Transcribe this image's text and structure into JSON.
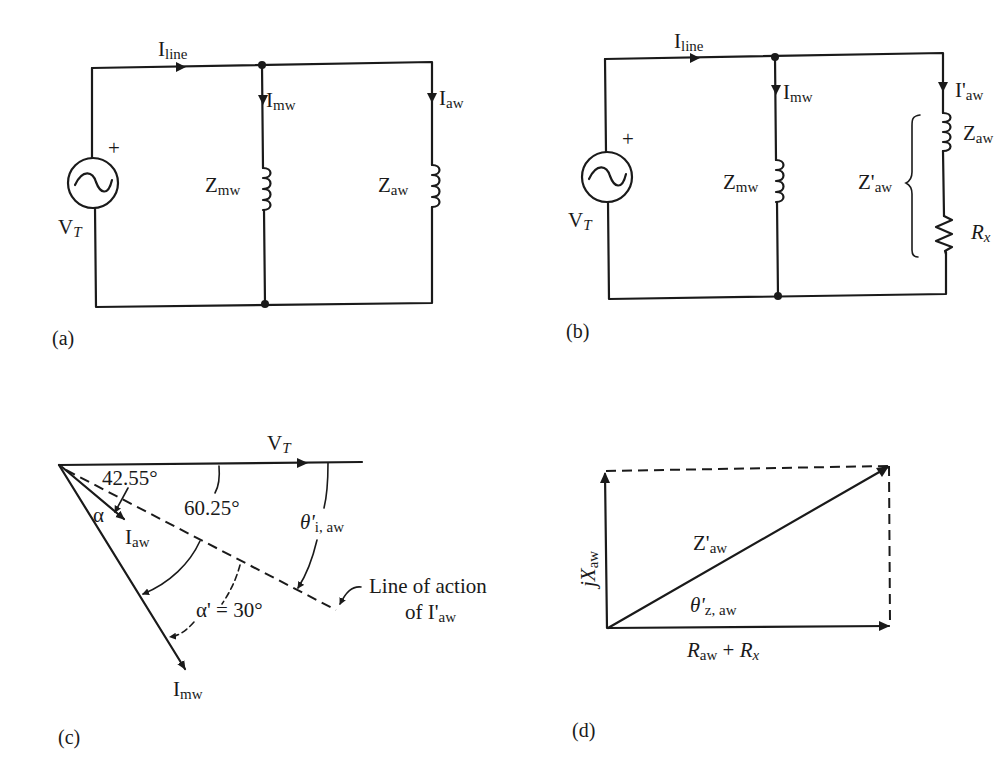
{
  "panels": {
    "a": {
      "caption": "(a)",
      "source": {
        "plus": "+",
        "label_main": "V",
        "label_sub": "T"
      },
      "line_current": {
        "main": "I",
        "sub": "line"
      },
      "branch1": {
        "current_main": "I",
        "current_sub": "mw",
        "impedance_main": "Z",
        "impedance_sub": "mw"
      },
      "branch2": {
        "current_main": "I",
        "current_sub": "aw",
        "impedance_main": "Z",
        "impedance_sub": "aw"
      }
    },
    "b": {
      "caption": "(b)",
      "source": {
        "plus": "+",
        "label_main": "V",
        "label_sub": "T"
      },
      "line_current": {
        "main": "I",
        "sub": "line"
      },
      "branch1": {
        "current_main": "I",
        "current_sub": "mw",
        "impedance_main": "Z",
        "impedance_sub": "mw"
      },
      "branch2": {
        "current_main": "I'",
        "current_sub": "aw",
        "impedance_main": "Z",
        "impedance_sub": "aw",
        "combined_main": "Z'",
        "combined_sub": "aw",
        "resistor_main": "R",
        "resistor_sub": "x"
      }
    },
    "c": {
      "caption": "(c)",
      "reference": {
        "main": "V",
        "sub": "T"
      },
      "angle_1": "42.55°",
      "angle_2": "60.25°",
      "alpha": "α",
      "alpha_prime": "α' = 30°",
      "theta_main": "θ'",
      "theta_sub": "i, aw",
      "iaw": {
        "main": "I",
        "sub": "aw"
      },
      "imw": {
        "main": "I",
        "sub": "mw"
      },
      "line_of_action_1": "Line of action",
      "line_of_action_2_pre": "of I'",
      "line_of_action_2_sub": "aw"
    },
    "d": {
      "caption": "(d)",
      "vertical": {
        "pre": "jX",
        "sub": "aw"
      },
      "hypotenuse": {
        "main": "Z'",
        "sub": "aw"
      },
      "angle": {
        "main": "θ'",
        "sub": "z, aw"
      },
      "horizontal": {
        "r1": "R",
        "r1_sub": "aw",
        "plus": " + ",
        "r2": "R",
        "r2_sub": "x"
      }
    }
  }
}
